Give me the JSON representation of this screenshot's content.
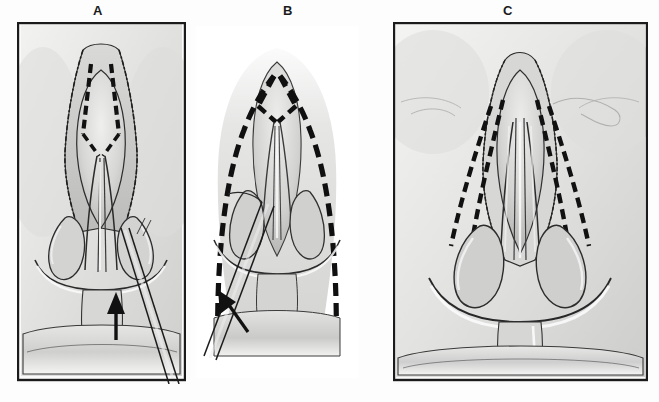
{
  "figure": {
    "type": "medical-illustration",
    "style": "grayscale pencil/wash anatomical drawing",
    "background_color": "#fdfdfd",
    "ink_color": "#1b1b1b",
    "panel_count": 3
  },
  "panels": [
    {
      "id": "A",
      "label": "A",
      "label_x": 98,
      "label_y": 4,
      "frame": {
        "x": 17,
        "y": 22,
        "width": 169,
        "height": 362,
        "border": true,
        "border_color": "#1b1b1b"
      },
      "description": "Open approach with columellar strut in place; dashed marking lines along the cephalic margins of the lower lateral cartilages; instrument shaft entering from lower right",
      "has_frame_border": true,
      "dashed_marking": "paired short dashed lines flanking the nasal dome",
      "arrow": {
        "present": true,
        "direction": "up",
        "tip_x": 112,
        "tip_y": 292,
        "tail_x": 116,
        "tail_y": 338
      },
      "instrument": {
        "present": true,
        "type": "retractor-shaft",
        "enters_from": "bottom-right"
      }
    },
    {
      "id": "B",
      "label": "B",
      "label_x": 288,
      "label_y": 4,
      "frame": {
        "x": 196,
        "y": 30,
        "width": 160,
        "height": 345,
        "border": false,
        "border_color": "none"
      },
      "description": "Borderless vignette showing bold dashed resection outline forming a pointed arch over the nasal tip and down the lateral walls; arrow indicates direction of elevation",
      "has_frame_border": false,
      "dashed_marking": "heavy dashed arch outlining the planned incision",
      "arrow": {
        "present": true,
        "direction": "up-left",
        "tip_x": 228,
        "tip_y": 290,
        "tail_x": 249,
        "tail_y": 325
      },
      "instrument": {
        "present": true,
        "type": "elevator-shaft",
        "enters_from": "bottom-left"
      }
    },
    {
      "id": "C",
      "label": "C",
      "label_x": 508,
      "label_y": 4,
      "frame": {
        "x": 393,
        "y": 22,
        "width": 255,
        "height": 362,
        "border": true,
        "border_color": "#1b1b1b"
      },
      "description": "Wider field view of the completed exposure with bilateral curved dashed lines sweeping laterally from the dome toward the alar bases; upper lip and philtrum visible below",
      "has_frame_border": true,
      "dashed_marking": "two pairs of long curved dashed lines diverging inferolaterally on each side",
      "arrow": {
        "present": false
      },
      "instrument": {
        "present": false
      }
    }
  ],
  "caption": {
    "visible": true,
    "clipped": true,
    "text": "",
    "note": "bottom caption line is cropped by the image edge; only faint ascender tops are rendered"
  }
}
